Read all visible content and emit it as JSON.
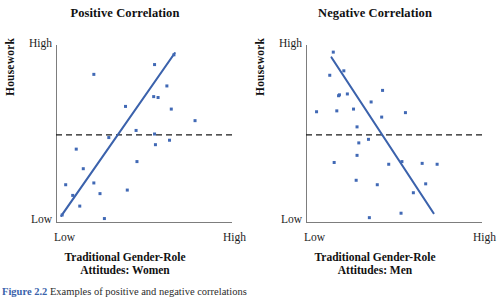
{
  "figure": {
    "caption_number": "Figure 2.2",
    "caption_text": "Examples of positive and negative correlations"
  },
  "colors": {
    "point": "#4169b5",
    "trend_line": "#3b62ac",
    "axis": "#7d7d7d",
    "reference_line": "#1a1a1a",
    "title_text": "#111111",
    "caption_accent": "#3a63ab"
  },
  "panels": {
    "left": {
      "title": "Positive Correlation",
      "ylabel": "Housework",
      "xlabel_line1": "Traditional Gender-Role",
      "xlabel_line2": "Attitudes: Women",
      "y_tick_high": "High",
      "y_tick_low": "Low",
      "x_tick_low": "Low",
      "x_tick_high": "High"
    },
    "right": {
      "title": "Negative Correlation",
      "ylabel": "Housework",
      "xlabel_line1": "Traditional Gender-Role",
      "xlabel_line2": "Attitudes: Men",
      "y_tick_high": "High",
      "y_tick_low": "Low",
      "x_tick_low": "Low",
      "x_tick_high": "High"
    }
  },
  "chart_data": [
    {
      "type": "scatter",
      "title": "Positive Correlation",
      "xlabel": "Traditional Gender-Role Attitudes: Women",
      "ylabel": "Housework",
      "xlim": [
        0,
        1
      ],
      "ylim": [
        0,
        1
      ],
      "xtick_labels": [
        "Low",
        "High"
      ],
      "ytick_labels": [
        "Low",
        "High"
      ],
      "grid": false,
      "legend": "none",
      "points": [
        {
          "x": 0.035,
          "y": 0.045
        },
        {
          "x": 0.095,
          "y": 0.155
        },
        {
          "x": 0.055,
          "y": 0.215
        },
        {
          "x": 0.135,
          "y": 0.095
        },
        {
          "x": 0.155,
          "y": 0.305
        },
        {
          "x": 0.215,
          "y": 0.225
        },
        {
          "x": 0.275,
          "y": 0.025
        },
        {
          "x": 0.3,
          "y": 0.48
        },
        {
          "x": 0.25,
          "y": 0.165
        },
        {
          "x": 0.115,
          "y": 0.415
        },
        {
          "x": 0.215,
          "y": 0.835
        },
        {
          "x": 0.405,
          "y": 0.185
        },
        {
          "x": 0.455,
          "y": 0.52
        },
        {
          "x": 0.395,
          "y": 0.655
        },
        {
          "x": 0.46,
          "y": 0.345
        },
        {
          "x": 0.56,
          "y": 0.5
        },
        {
          "x": 0.56,
          "y": 0.89
        },
        {
          "x": 0.565,
          "y": 0.44
        },
        {
          "x": 0.555,
          "y": 0.71
        },
        {
          "x": 0.67,
          "y": 0.945
        },
        {
          "x": 0.63,
          "y": 0.77
        },
        {
          "x": 0.655,
          "y": 0.64
        },
        {
          "x": 0.645,
          "y": 0.465
        },
        {
          "x": 0.79,
          "y": 0.575
        },
        {
          "x": 0.58,
          "y": 0.705
        }
      ],
      "trend_line": {
        "x1": 0.03,
        "y1": 0.04,
        "x2": 0.675,
        "y2": 0.955,
        "slope_sign": "positive"
      },
      "reference_line": {
        "y": 0.495,
        "style": "dashed",
        "span": "full-width"
      }
    },
    {
      "type": "scatter",
      "title": "Negative Correlation",
      "xlabel": "Traditional Gender-Role Attitudes: Men",
      "ylabel": "Housework",
      "xlim": [
        0,
        1
      ],
      "ylim": [
        0,
        1
      ],
      "xtick_labels": [
        "Low",
        "High"
      ],
      "ytick_labels": [
        "Low",
        "High"
      ],
      "grid": false,
      "legend": "none",
      "points": [
        {
          "x": 0.155,
          "y": 0.96
        },
        {
          "x": 0.215,
          "y": 0.855
        },
        {
          "x": 0.135,
          "y": 0.83
        },
        {
          "x": 0.19,
          "y": 0.72
        },
        {
          "x": 0.185,
          "y": 0.715
        },
        {
          "x": 0.235,
          "y": 0.725
        },
        {
          "x": 0.06,
          "y": 0.625
        },
        {
          "x": 0.175,
          "y": 0.63
        },
        {
          "x": 0.27,
          "y": 0.64
        },
        {
          "x": 0.29,
          "y": 0.54
        },
        {
          "x": 0.3,
          "y": 0.45
        },
        {
          "x": 0.29,
          "y": 0.38
        },
        {
          "x": 0.16,
          "y": 0.34
        },
        {
          "x": 0.285,
          "y": 0.24
        },
        {
          "x": 0.37,
          "y": 0.68
        },
        {
          "x": 0.435,
          "y": 0.745
        },
        {
          "x": 0.43,
          "y": 0.595
        },
        {
          "x": 0.355,
          "y": 0.47
        },
        {
          "x": 0.36,
          "y": 0.03
        },
        {
          "x": 0.405,
          "y": 0.215
        },
        {
          "x": 0.565,
          "y": 0.62
        },
        {
          "x": 0.545,
          "y": 0.345
        },
        {
          "x": 0.47,
          "y": 0.33
        },
        {
          "x": 0.61,
          "y": 0.17
        },
        {
          "x": 0.54,
          "y": 0.055
        },
        {
          "x": 0.68,
          "y": 0.22
        },
        {
          "x": 0.745,
          "y": 0.33
        },
        {
          "x": 0.66,
          "y": 0.335
        }
      ],
      "trend_line": {
        "x1": 0.145,
        "y1": 0.93,
        "x2": 0.725,
        "y2": 0.055,
        "slope_sign": "negative"
      },
      "reference_line": {
        "y": 0.495,
        "style": "dashed",
        "span": "full-width"
      }
    }
  ]
}
